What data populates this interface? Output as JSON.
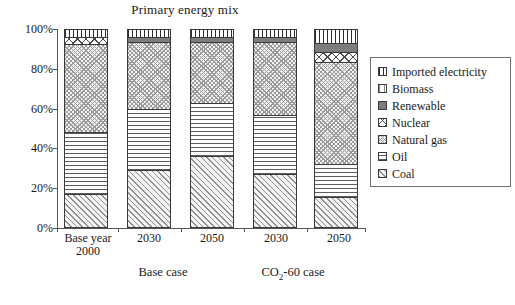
{
  "chart_data": {
    "type": "bar",
    "subtype": "stacked-percentage-column",
    "title": "Primary energy mix",
    "xlabel": "",
    "ylabel": "",
    "ylim": [
      0,
      100
    ],
    "ytick_labels": [
      "0%",
      "20%",
      "40%",
      "60%",
      "80%",
      "100%"
    ],
    "ytick_values": [
      0,
      20,
      40,
      60,
      80,
      100
    ],
    "grid": false,
    "legend_position": "right",
    "categories": [
      "Base year\n2000",
      "2030",
      "2050",
      "2030",
      "2050"
    ],
    "category_labels": [
      {
        "line1": "Base year",
        "line2": "2000"
      },
      {
        "line1": "2030",
        "line2": ""
      },
      {
        "line1": "2050",
        "line2": ""
      },
      {
        "line1": "2030",
        "line2": ""
      },
      {
        "line1": "2050",
        "line2": ""
      }
    ],
    "groups": [
      {
        "label": "Base case",
        "members": [
          1,
          2
        ]
      },
      {
        "label_prefix": "CO",
        "label_sub": "2",
        "label_suffix": "-60 case",
        "members": [
          3,
          4
        ]
      }
    ],
    "series": [
      {
        "name": "Coal",
        "pattern": "diagonal-hatch",
        "values": [
          17,
          29,
          36,
          27,
          15
        ]
      },
      {
        "name": "Oil",
        "pattern": "horizontal-lines",
        "values": [
          31,
          31,
          27,
          30,
          17
        ]
      },
      {
        "name": "Natural gas",
        "pattern": "cross-hatch",
        "values": [
          45,
          34,
          31,
          37,
          52
        ]
      },
      {
        "name": "Nuclear",
        "pattern": "diamond",
        "values": [
          3.5,
          0,
          0,
          0,
          5
        ]
      },
      {
        "name": "Renewable",
        "pattern": "solid-gray",
        "values": [
          0,
          2.5,
          2.5,
          2.5,
          4.5
        ]
      },
      {
        "name": "Biomass",
        "pattern": "vertical-light",
        "values": [
          0,
          0,
          0,
          0,
          0
        ]
      },
      {
        "name": "Imported electricity",
        "pattern": "vertical-dark",
        "values": [
          3.5,
          3.5,
          3.5,
          3.5,
          6.5
        ]
      }
    ],
    "legend_entries": [
      {
        "label": "Imported electricity",
        "pattern": "vertical-dark"
      },
      {
        "label": "Biomass",
        "pattern": "vertical-light"
      },
      {
        "label": "Renewable",
        "pattern": "solid-gray"
      },
      {
        "label": "Nuclear",
        "pattern": "diamond"
      },
      {
        "label": "Natural gas",
        "pattern": "cross-hatch"
      },
      {
        "label": "Oil",
        "pattern": "horizontal-lines"
      },
      {
        "label": "Coal",
        "pattern": "diagonal-hatch"
      }
    ]
  }
}
